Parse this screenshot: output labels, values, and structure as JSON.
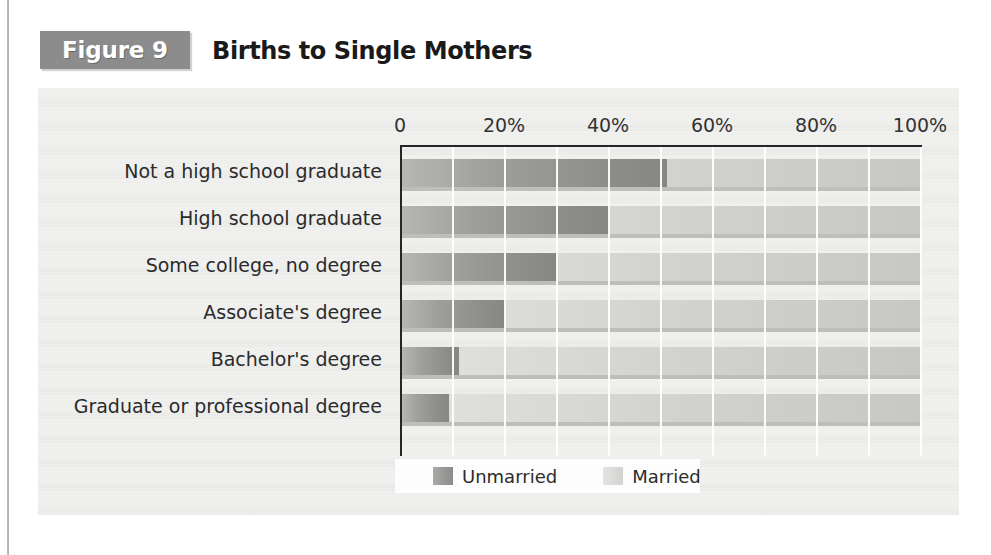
{
  "figure": {
    "tag": "Figure 9",
    "title": "Births to Single Mothers"
  },
  "chart_data": {
    "type": "bar",
    "orientation": "horizontal",
    "stacked": true,
    "title": "Births to Single Mothers",
    "xlabel": "",
    "ylabel": "",
    "xlim": [
      0,
      100
    ],
    "xticks": [
      0,
      20,
      40,
      60,
      80,
      100
    ],
    "xtick_labels": [
      "0",
      "20%",
      "40%",
      "60%",
      "80%",
      "100%"
    ],
    "grid": true,
    "grid_axis": "x",
    "grid_interval": 10,
    "legend_position": "bottom",
    "categories": [
      "Not a high school graduate",
      "High school graduate",
      "Some college, no degree",
      "Associate's degree",
      "Bachelor's degree",
      "Graduate or professional degree"
    ],
    "series": [
      {
        "name": "Unmarried",
        "color": "#8e8e8c",
        "values": [
          51,
          40,
          30,
          20,
          11,
          9
        ]
      },
      {
        "name": "Married",
        "color": "#d4d4d2",
        "values": [
          49,
          60,
          70,
          80,
          89,
          91
        ]
      }
    ]
  },
  "legend": {
    "items": [
      {
        "label": "Unmarried",
        "swatch": "unmarried-swatch"
      },
      {
        "label": "Married",
        "swatch": "married-swatch"
      }
    ]
  },
  "colors": {
    "tag_background": "#8c8c8c",
    "tag_text": "#ffffff",
    "panel_background": "#f0f0ef",
    "axis_line": "#262626",
    "unmarried": "#8e8e8c",
    "married": "#d4d4d2",
    "title_text": "#1a1a1a"
  }
}
